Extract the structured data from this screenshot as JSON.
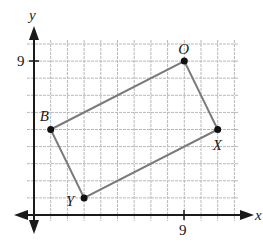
{
  "diagram": {
    "type": "coordinate-plane-quadrilateral",
    "axes": {
      "x_label": "x",
      "y_label": "y",
      "x_tick_label": "9",
      "y_tick_label": "9",
      "x_tick_value": 9,
      "y_tick_value": 9
    },
    "grid": {
      "x_min": 0,
      "x_max": 12,
      "y_min": 0,
      "y_max": 10,
      "step": 1
    },
    "points": [
      {
        "name": "O",
        "x": 9,
        "y": 9
      },
      {
        "name": "X",
        "x": 11,
        "y": 5
      },
      {
        "name": "Y",
        "x": 3,
        "y": 1
      },
      {
        "name": "B",
        "x": 1,
        "y": 5
      }
    ],
    "polygon_order": [
      "B",
      "O",
      "X",
      "Y"
    ],
    "colors": {
      "axis": "#1a1a1a",
      "grid": "#b8b8b8",
      "edge": "#7a7a7a",
      "point": "#111111"
    }
  }
}
